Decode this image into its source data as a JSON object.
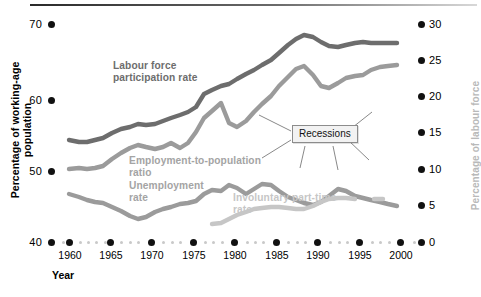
{
  "chart_data": {
    "type": "line",
    "title": "",
    "xlabel": "Year",
    "ylabel": "Percentage of working-age population",
    "y2label": "Percentage of labour force",
    "xlim": [
      1958,
      2001
    ],
    "ylim": [
      40,
      70
    ],
    "y2lim": [
      0,
      30
    ],
    "grid": false,
    "legend": "inline annotations on curves",
    "xticks": [
      "1960",
      "1965",
      "1970",
      "1975",
      "1980",
      "1985",
      "1990",
      "1995",
      "2000"
    ],
    "yticks": [
      "40",
      "50",
      "60",
      "70"
    ],
    "y2ticks": [
      "0",
      "5",
      "10",
      "15",
      "20",
      "25",
      "30"
    ],
    "annotations": [
      "Recessions"
    ],
    "series": [
      {
        "name": "Labour force participation rate",
        "axis": "left",
        "color": "#6d6d6d",
        "x": [
          1958,
          1960,
          1962,
          1964,
          1966,
          1968,
          1970,
          1972,
          1974,
          1976,
          1978,
          1980,
          1982,
          1984,
          1986,
          1988,
          1990,
          1992,
          1994,
          1996,
          1998,
          2000
        ],
        "values": [
          54.3,
          54.0,
          54.2,
          54.6,
          55.5,
          56.0,
          56.9,
          57.0,
          58.2,
          59.1,
          61.0,
          62.3,
          63.0,
          63.9,
          65.0,
          66.0,
          66.9,
          66.2,
          66.1,
          66.5,
          66.4,
          66.3
        ]
      },
      {
        "name": "Employment-to-population ratio",
        "axis": "left",
        "color": "#9b9b9b",
        "x": [
          1958,
          1960,
          1962,
          1964,
          1966,
          1968,
          1970,
          1972,
          1974,
          1976,
          1978,
          1980,
          1982,
          1984,
          1986,
          1988,
          1990,
          1992,
          1994,
          1996,
          1998,
          2000
        ],
        "values": [
          50.4,
          50.6,
          50.8,
          51.4,
          52.6,
          53.5,
          54.0,
          53.9,
          55.5,
          54.6,
          57.6,
          58.0,
          56.2,
          58.4,
          60.1,
          61.5,
          62.5,
          60.7,
          61.6,
          62.9,
          63.1,
          63.2
        ]
      },
      {
        "name": "Unemployment rate",
        "axis": "right",
        "color": "#9b9b9b",
        "x": [
          1958,
          1960,
          1962,
          1964,
          1966,
          1968,
          1970,
          1972,
          1974,
          1976,
          1978,
          1980,
          1982,
          1984,
          1986,
          1988,
          1990,
          1992,
          1994,
          1996,
          1998,
          2000
        ],
        "values": [
          6.8,
          5.5,
          5.5,
          5.2,
          3.8,
          3.6,
          4.9,
          5.6,
          5.6,
          7.7,
          6.1,
          7.1,
          9.7,
          7.5,
          7.0,
          5.5,
          5.6,
          7.5,
          6.1,
          5.4,
          4.5,
          4.0
        ]
      },
      {
        "name": "Involuntary part-time rate",
        "axis": "right",
        "color": "#c6c6c6",
        "x": [
          1976,
          1978,
          1980,
          1982,
          1984,
          1986,
          1988,
          1990,
          1992,
          1994,
          1996,
          1998,
          2000
        ],
        "values": [
          2.6,
          2.7,
          3.2,
          4.3,
          4.4,
          4.3,
          4.1,
          4.3,
          5.2,
          5.4,
          5.3,
          5.0,
          5.0
        ]
      }
    ]
  },
  "axes": {
    "left_title": "Percentage of working-age population",
    "right_title": "Percentage of labour force",
    "x_title": "Year"
  },
  "labels": {
    "lfp": "Labour force\nparticipation rate",
    "lfp_line1": "Labour force",
    "lfp_line2": "participation rate",
    "epr_line1": "Employment-to-population",
    "epr_line2": "ratio",
    "ur_line1": "Unemployment",
    "ur_line2": "rate",
    "ipt_line1": "Involuntary part-time",
    "ipt_line2": "rate",
    "recessions": "Recessions"
  },
  "ticks": {
    "left": [
      "70",
      "60",
      "50",
      "40"
    ],
    "right": [
      "30",
      "25",
      "20",
      "15",
      "10",
      "5",
      "0"
    ],
    "x": [
      "1960",
      "1965",
      "1970",
      "1975",
      "1980",
      "1985",
      "1990",
      "1995",
      "2000"
    ]
  },
  "colors": {
    "labour_force": "#6d6d6d",
    "employment_population": "#9b9b9b",
    "unemployment": "#9b9b9b",
    "involuntary_parttime": "#c6c6c6",
    "axis_text": "#000000",
    "right_axis_title": "#b9b9b9"
  }
}
